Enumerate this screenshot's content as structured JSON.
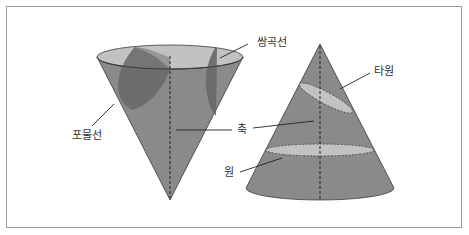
{
  "figure": {
    "labels": {
      "hyperbola": "쌍곡선",
      "parabola": "포물선",
      "axis": "축",
      "ellipse": "타원",
      "circle": "원"
    },
    "colors": {
      "cone_body": "#8a8a8a",
      "section_light": "#c2c2c2",
      "section_dark": "#676767",
      "outline": "#3a3a3a",
      "frame": "#9a9a9a"
    }
  }
}
